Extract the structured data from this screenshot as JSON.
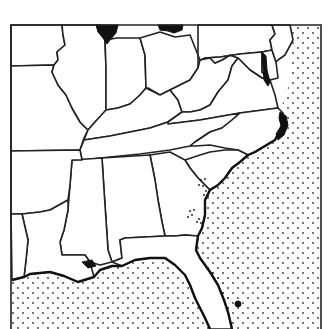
{
  "map": {
    "region": "Southeastern United States",
    "ocean_pattern": "stippled dots",
    "colors": {
      "background": "#ffffff",
      "boundary": "#222222",
      "water_fill": "#111111",
      "ocean_dot": "#333333"
    },
    "features": {
      "lake_michigan": "lake-michigan",
      "lake_erie": "lake-erie",
      "chesapeake_bay": "chesapeake-bay",
      "pamlico_sound": "pamlico-sound",
      "lake_pontchartrain": "lake-pontchartrain",
      "lake_okeechobee": "lake-okeechobee",
      "georgia_dot_clusters": "dot-clusters"
    }
  }
}
